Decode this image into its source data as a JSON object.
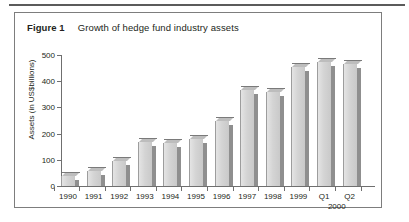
{
  "figure": {
    "label": "Figure 1",
    "title": "Growth of hedge fund industry assets"
  },
  "chart_data": {
    "type": "bar",
    "title": "Growth of hedge fund industry assets",
    "xlabel": "",
    "ylabel": "Assets (in US$billions)",
    "ylim": [
      0,
      500
    ],
    "yticks": [
      0,
      100,
      200,
      300,
      400,
      500
    ],
    "grid": false,
    "legend": null,
    "group_label": "2000",
    "categories": [
      "1990",
      "1991",
      "1992",
      "1993",
      "1994",
      "1995",
      "1996",
      "1997",
      "1998",
      "1999",
      "Q1",
      "Q2"
    ],
    "values": [
      39,
      58,
      95,
      167,
      165,
      180,
      250,
      365,
      360,
      455,
      475,
      465
    ]
  },
  "colors": {
    "bar_face": "#d4d4d4",
    "bar_side": "#8f8f8f",
    "bar_top": "#bdbdbd",
    "axis": "#6f6f6f",
    "frame": "#7d7d7d",
    "rule": "#5b5b5b",
    "text": "#231f20"
  }
}
